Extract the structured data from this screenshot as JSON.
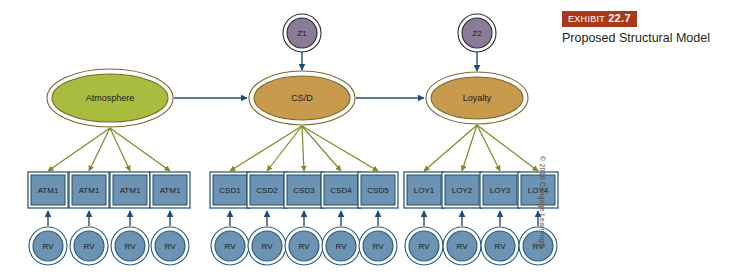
{
  "exhibit": {
    "badge_word": "EXHIBIT",
    "badge_number": "22.7",
    "caption": "Proposed Structural Model",
    "badge_color": "#a8391b"
  },
  "copyright": "© 2016 Cengage Learning®",
  "colors": {
    "atmosphere_fill": "#a8bc3f",
    "construct_fill": "#c89a4e",
    "construct_stroke": "#7a6a28",
    "disturbance_fill": "#8a7c96",
    "disturbance_stroke": "#2b2b2b",
    "indicator_fill": "#6d93b4",
    "indicator_stroke": "#1f4e6b",
    "residual_fill": "#6d93b4",
    "residual_stroke": "#2a5a7a",
    "structural_arrow": "#1f4e79",
    "loading_arrow": "#7d8a27"
  },
  "constructs": [
    {
      "id": "atmosphere",
      "label": "Atmosphere",
      "cx": 110,
      "cy": 98,
      "rx": 58,
      "ry": 24,
      "fill_key": "atmosphere_fill"
    },
    {
      "id": "csd",
      "label": "CS/D",
      "cx": 302,
      "cy": 98,
      "rx": 48,
      "ry": 22,
      "fill_key": "construct_fill"
    },
    {
      "id": "loyalty",
      "label": "Loyalty",
      "cx": 477,
      "cy": 98,
      "rx": 46,
      "ry": 21,
      "fill_key": "construct_fill"
    }
  ],
  "disturbances": [
    {
      "id": "z1",
      "label": "Z1",
      "cx": 302,
      "cy": 33,
      "r": 15,
      "target": "csd"
    },
    {
      "id": "z2",
      "label": "Z2",
      "cx": 477,
      "cy": 33,
      "r": 15,
      "target": "loyalty"
    }
  ],
  "structural_paths": [
    {
      "from": "atmosphere",
      "to": "csd"
    },
    {
      "from": "csd",
      "to": "loyalty"
    }
  ],
  "indicator_groups": [
    {
      "construct": "atmosphere",
      "indicators": [
        {
          "label": "ATM1",
          "cx": 48
        },
        {
          "label": "ATM1",
          "cx": 89
        },
        {
          "label": "ATM1",
          "cx": 130
        },
        {
          "label": "ATM1",
          "cx": 170
        }
      ]
    },
    {
      "construct": "csd",
      "indicators": [
        {
          "label": "CSD1",
          "cx": 230
        },
        {
          "label": "CSD2",
          "cx": 267
        },
        {
          "label": "CSD3",
          "cx": 304
        },
        {
          "label": "CSD4",
          "cx": 341
        },
        {
          "label": "CSD5",
          "cx": 378
        }
      ]
    },
    {
      "construct": "loyalty",
      "indicators": [
        {
          "label": "LOY1",
          "cx": 424
        },
        {
          "label": "LOY2",
          "cx": 462
        },
        {
          "label": "LOY3",
          "cx": 500
        },
        {
          "label": "LOY4",
          "cx": 538
        }
      ]
    }
  ],
  "indicator_geometry": {
    "cy": 190,
    "width": 34,
    "height": 30
  },
  "residuals": {
    "label": "RV",
    "cy": 246,
    "r": 15
  }
}
